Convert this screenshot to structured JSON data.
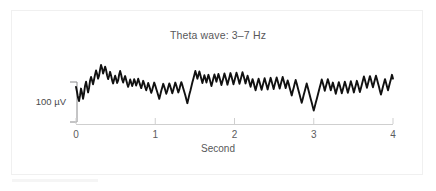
{
  "figure": {
    "title": "Theta wave: 3–7 Hz",
    "background_color": "#ffffff",
    "border_color": "#f0f0f0",
    "trace_color": "#111111",
    "axis_color": "#cfcfcf",
    "text_color": "#58585a"
  },
  "y_scalebar": {
    "label": "100 µV",
    "units": "µV",
    "value": 100
  },
  "x_axis": {
    "label": "Second",
    "ticks": [
      "0",
      "1",
      "2",
      "3",
      "4"
    ],
    "tick_values": [
      0,
      1,
      2,
      3,
      4
    ],
    "range": [
      0,
      4
    ]
  },
  "chart_data": {
    "type": "line",
    "title": "Theta wave: 3–7 Hz",
    "xlabel": "Second",
    "ylabel": "100 µV",
    "xlim": [
      0,
      4
    ],
    "ylim": [
      -130,
      130
    ],
    "grid": false,
    "legend": null,
    "annotations": [
      {
        "text": "100 µV",
        "type": "y-scalebar",
        "value": 100
      }
    ],
    "series": [
      {
        "name": "Theta wave EEG",
        "color": "#111111",
        "x": [
          0.0,
          0.013,
          0.025,
          0.038,
          0.051,
          0.063,
          0.076,
          0.089,
          0.101,
          0.114,
          0.127,
          0.139,
          0.152,
          0.165,
          0.177,
          0.19,
          0.203,
          0.215,
          0.228,
          0.241,
          0.253,
          0.266,
          0.278,
          0.291,
          0.304,
          0.316,
          0.329,
          0.342,
          0.354,
          0.367,
          0.38,
          0.392,
          0.405,
          0.418,
          0.43,
          0.443,
          0.456,
          0.468,
          0.481,
          0.494,
          0.506,
          0.519,
          0.532,
          0.544,
          0.557,
          0.57,
          0.582,
          0.595,
          0.608,
          0.62,
          0.633,
          0.646,
          0.658,
          0.671,
          0.684,
          0.696,
          0.709,
          0.722,
          0.734,
          0.747,
          0.759,
          0.772,
          0.785,
          0.797,
          0.81,
          0.823,
          0.835,
          0.848,
          0.861,
          0.873,
          0.886,
          0.899,
          0.911,
          0.924,
          0.937,
          0.949,
          0.962,
          0.975,
          0.987,
          1.0,
          1.013,
          1.025,
          1.038,
          1.051,
          1.063,
          1.076,
          1.089,
          1.101,
          1.114,
          1.127,
          1.139,
          1.152,
          1.165,
          1.177,
          1.19,
          1.203,
          1.215,
          1.228,
          1.241,
          1.253,
          1.266,
          1.278,
          1.291,
          1.304,
          1.316,
          1.329,
          1.342,
          1.354,
          1.367,
          1.38,
          1.392,
          1.405,
          1.418,
          1.43,
          1.443,
          1.456,
          1.468,
          1.481,
          1.494,
          1.506,
          1.519,
          1.532,
          1.544,
          1.557,
          1.57,
          1.582,
          1.595,
          1.608,
          1.62,
          1.633,
          1.646,
          1.658,
          1.671,
          1.684,
          1.696,
          1.709,
          1.722,
          1.734,
          1.747,
          1.759,
          1.772,
          1.785,
          1.797,
          1.81,
          1.823,
          1.835,
          1.848,
          1.861,
          1.873,
          1.886,
          1.899,
          1.911,
          1.924,
          1.937,
          1.949,
          1.962,
          1.975,
          1.987,
          2.0,
          2.013,
          2.025,
          2.038,
          2.051,
          2.063,
          2.076,
          2.089,
          2.101,
          2.114,
          2.127,
          2.139,
          2.152,
          2.165,
          2.177,
          2.19,
          2.203,
          2.215,
          2.228,
          2.241,
          2.253,
          2.266,
          2.278,
          2.291,
          2.304,
          2.316,
          2.329,
          2.342,
          2.354,
          2.367,
          2.38,
          2.392,
          2.405,
          2.418,
          2.43,
          2.443,
          2.456,
          2.468,
          2.481,
          2.494,
          2.506,
          2.519,
          2.532,
          2.544,
          2.557,
          2.57,
          2.582,
          2.595,
          2.608,
          2.62,
          2.633,
          2.646,
          2.658,
          2.671,
          2.684,
          2.696,
          2.709,
          2.722,
          2.734,
          2.747,
          2.759,
          2.772,
          2.785,
          2.797,
          2.81,
          2.823,
          2.835,
          2.848,
          2.861,
          2.873,
          2.886,
          2.899,
          2.911,
          2.924,
          2.937,
          2.949,
          2.962,
          2.975,
          2.987,
          3.0,
          3.013,
          3.025,
          3.038,
          3.051,
          3.063,
          3.076,
          3.089,
          3.101,
          3.114,
          3.127,
          3.139,
          3.152,
          3.165,
          3.177,
          3.19,
          3.203,
          3.215,
          3.228,
          3.241,
          3.253,
          3.266,
          3.278,
          3.291,
          3.304,
          3.316,
          3.329,
          3.342,
          3.354,
          3.367,
          3.38,
          3.392,
          3.405,
          3.418,
          3.43,
          3.443,
          3.456,
          3.468,
          3.481,
          3.494,
          3.506,
          3.519,
          3.532,
          3.544,
          3.557,
          3.57,
          3.582,
          3.595,
          3.608,
          3.62,
          3.633,
          3.646,
          3.658,
          3.671,
          3.684,
          3.696,
          3.709,
          3.722,
          3.734,
          3.747,
          3.759,
          3.772,
          3.785,
          3.797,
          3.81,
          3.823,
          3.835,
          3.848,
          3.861,
          3.873,
          3.886,
          3.899,
          3.911,
          3.924,
          3.937,
          3.949,
          3.962,
          3.975,
          3.987,
          4.0
        ],
        "y": [
          10,
          -14,
          -40,
          -56,
          -30,
          2,
          -18,
          -46,
          -22,
          14,
          34,
          10,
          -16,
          6,
          38,
          56,
          40,
          22,
          44,
          68,
          86,
          70,
          48,
          62,
          90,
          112,
          96,
          72,
          86,
          104,
          88,
          64,
          46,
          62,
          80,
          62,
          40,
          26,
          44,
          62,
          46,
          28,
          40,
          66,
          84,
          66,
          44,
          30,
          48,
          60,
          42,
          24,
          10,
          26,
          44,
          30,
          14,
          28,
          46,
          32,
          16,
          30,
          48,
          34,
          18,
          4,
          20,
          38,
          24,
          8,
          -6,
          10,
          28,
          14,
          -2,
          -18,
          -4,
          14,
          30,
          16,
          0,
          -14,
          -30,
          -46,
          -28,
          -8,
          8,
          24,
          10,
          -6,
          -22,
          -8,
          10,
          26,
          12,
          -4,
          -20,
          -4,
          14,
          30,
          16,
          0,
          -16,
          -2,
          16,
          32,
          18,
          2,
          -14,
          -30,
          -48,
          -66,
          -46,
          -26,
          -8,
          12,
          30,
          48,
          66,
          84,
          66,
          48,
          64,
          82,
          64,
          46,
          28,
          46,
          64,
          48,
          30,
          48,
          66,
          50,
          32,
          14,
          32,
          50,
          68,
          52,
          34,
          52,
          70,
          54,
          36,
          18,
          36,
          54,
          72,
          56,
          38,
          20,
          38,
          56,
          74,
          58,
          40,
          22,
          40,
          58,
          76,
          60,
          42,
          24,
          42,
          60,
          78,
          62,
          44,
          26,
          44,
          62,
          46,
          28,
          10,
          28,
          46,
          30,
          12,
          -6,
          12,
          30,
          48,
          32,
          14,
          -4,
          14,
          32,
          50,
          34,
          16,
          -2,
          16,
          34,
          52,
          36,
          18,
          0,
          18,
          36,
          54,
          38,
          20,
          2,
          20,
          38,
          56,
          40,
          22,
          4,
          22,
          40,
          24,
          6,
          -12,
          -30,
          -12,
          6,
          24,
          42,
          26,
          8,
          -10,
          -28,
          -46,
          -64,
          -46,
          -28,
          -10,
          8,
          26,
          8,
          -10,
          -28,
          -46,
          -64,
          -82,
          -100,
          -82,
          -64,
          -46,
          -28,
          -10,
          8,
          26,
          44,
          28,
          10,
          -8,
          10,
          28,
          46,
          30,
          12,
          -6,
          12,
          30,
          14,
          -4,
          -22,
          -4,
          14,
          32,
          16,
          -2,
          -20,
          -2,
          16,
          34,
          18,
          0,
          -18,
          0,
          18,
          36,
          20,
          2,
          -16,
          2,
          20,
          38,
          22,
          4,
          -14,
          4,
          22,
          40,
          58,
          42,
          24,
          6,
          24,
          42,
          60,
          44,
          26,
          8,
          26,
          44,
          62,
          46,
          28,
          10,
          -8,
          -26,
          -8,
          10,
          28,
          46,
          30,
          12,
          -6,
          12,
          30,
          48,
          66,
          48
        ]
      }
    ]
  }
}
